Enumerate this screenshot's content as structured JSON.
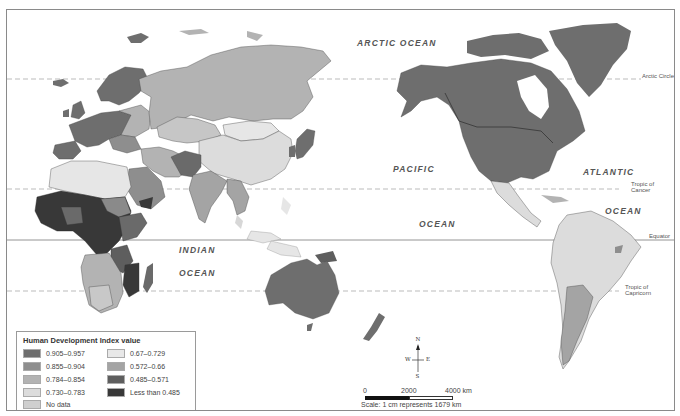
{
  "map": {
    "title": "Human Development Index value",
    "ocean_labels": {
      "arctic": "ARCTIC OCEAN",
      "pacific_1": "PACIFIC",
      "pacific_2": "OCEAN",
      "atlantic_1": "ATLANTIC",
      "atlantic_2": "OCEAN",
      "indian_1": "INDIAN",
      "indian_2": "OCEAN"
    },
    "reference_lines": {
      "arctic_circle": "Arctic Circle",
      "tropic_cancer": "Tropic of Cancer",
      "equator": "Equator",
      "tropic_capricorn": "Tropic of Capricorn"
    },
    "colors": {
      "c1": "#6e6e6e",
      "c2": "#8e8e8e",
      "c3": "#b3b3b3",
      "c4": "#d7d7d7",
      "c5": "#e6e6e6",
      "c6": "#a2a2a2",
      "c7": "#5f5f5f",
      "c8": "#3a3a3a",
      "nodata": "#cfcfcf"
    }
  },
  "legend": {
    "title": "Human Development Index value",
    "items": [
      {
        "label": "0.905–0.957",
        "color": "#6e6e6e"
      },
      {
        "label": "0.855–0.904",
        "color": "#8e8e8e"
      },
      {
        "label": "0.784–0.854",
        "color": "#b3b3b3"
      },
      {
        "label": "0.730–0.783",
        "color": "#dcdcdc"
      },
      {
        "label": "No data",
        "color": "#cfcfcf"
      },
      {
        "label": "0.67–0.729",
        "color": "#e8e8e8"
      },
      {
        "label": "0.572–0.66",
        "color": "#a4a4a4"
      },
      {
        "label": "0.485–0.571",
        "color": "#5e5e5e"
      },
      {
        "label": "Less than 0.485",
        "color": "#383838"
      }
    ]
  },
  "compass": {
    "n": "N",
    "s": "S",
    "e": "E",
    "w": "W"
  },
  "scale": {
    "tick_0": "0",
    "tick_1": "2000",
    "tick_2": "4000 km",
    "caption": "Scale: 1 cm represents 1679 km"
  }
}
